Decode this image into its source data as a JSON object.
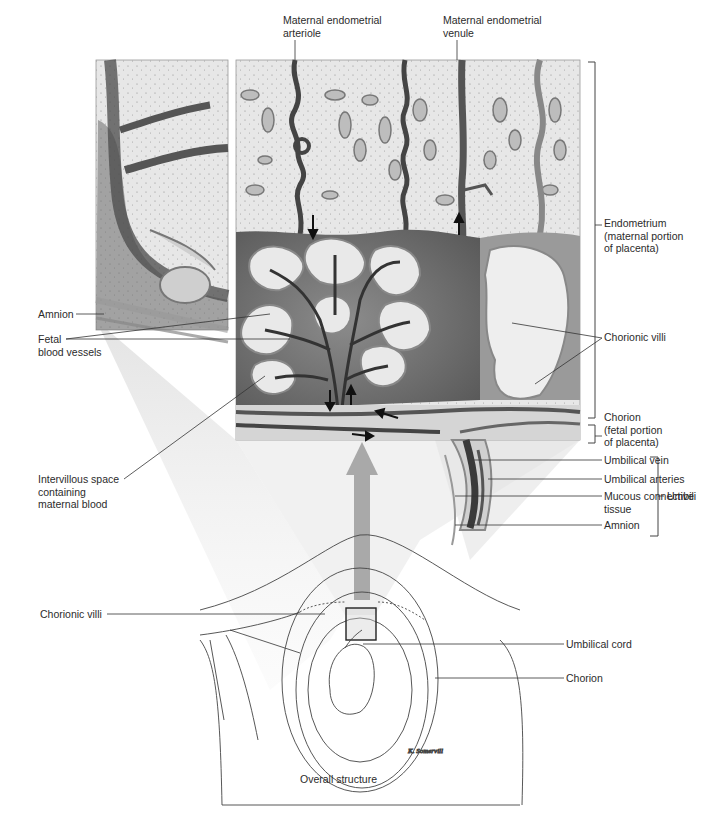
{
  "figure": {
    "caption": "Overall structure",
    "signature": "K. Somervill"
  },
  "labels": {
    "top": {
      "arteriole": "Maternal endometrial\narteriole",
      "venule": "Maternal endometrial\nvenule"
    },
    "right": {
      "endometrium": "Endometrium\n(maternal portion\nof placenta)",
      "chorionic_villi": "Chorionic villi",
      "chorion": "Chorion\n(fetal portion\nof placenta)",
      "umbilical_vein": "Umbilical vein",
      "umbilical_arteries": "Umbilical arteries",
      "mucous_connective_tissue": "Mucous connective\ntissue",
      "amnion": "Amnion",
      "umbilical_cord_group": "Umbili"
    },
    "left": {
      "amnion": "Amnion",
      "fetal_blood_vessels": "Fetal\nblood vessels",
      "intervillous_space": "Intervillous space\ncontaining\nmaternal blood"
    },
    "lower": {
      "chorionic_villi": "Chorionic villi",
      "umbilical_cord": "Umbilical cord",
      "chorion": "Chorion"
    }
  },
  "colors": {
    "background": "#ffffff",
    "stroma": "#e4e4e4",
    "dark_vessel": "#4a4a4a",
    "intervillous": "#6e6e6e",
    "villus_light": "#efefef",
    "cone_shadow": "#dcdcdc",
    "line": "#333333"
  }
}
